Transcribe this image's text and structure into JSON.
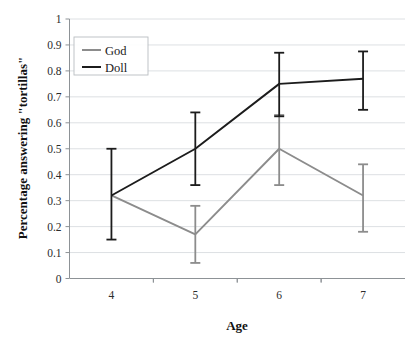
{
  "chart_data": {
    "type": "line",
    "title": "",
    "xlabel": "Age",
    "ylabel": "Percentage answering \"tortillas\"",
    "categories": [
      "4",
      "5",
      "6",
      "7"
    ],
    "x": [
      4,
      5,
      6,
      7
    ],
    "xlim": [
      3.5,
      7.5
    ],
    "ylim": [
      0,
      1
    ],
    "ytick_labels": [
      "0",
      "0.1",
      "0.2",
      "0.3",
      "0.4",
      "0.5",
      "0.6",
      "0.7",
      "0.8",
      "0.9",
      "1"
    ],
    "ytick_values": [
      0,
      0.1,
      0.2,
      0.3,
      0.4,
      0.5,
      0.6,
      0.7,
      0.8,
      0.9,
      1
    ],
    "grid": true,
    "legend_position": "top-left",
    "series": [
      {
        "name": "God",
        "color": "#8c8c8c",
        "values": [
          0.32,
          0.17,
          0.5,
          0.32
        ],
        "error_low": [
          0.32,
          0.06,
          0.36,
          0.18
        ],
        "error_high": [
          0.32,
          0.28,
          0.63,
          0.44
        ]
      },
      {
        "name": "Doll",
        "color": "#1c1c1c",
        "values": [
          0.32,
          0.5,
          0.75,
          0.77
        ],
        "error_low": [
          0.15,
          0.36,
          0.625,
          0.65
        ],
        "error_high": [
          0.5,
          0.64,
          0.87,
          0.875
        ]
      }
    ]
  },
  "legend": {
    "entries": [
      {
        "label": "God"
      },
      {
        "label": "Doll"
      }
    ]
  },
  "colors": {
    "god_series": "#8c8c8c",
    "doll_series": "#1c1c1c",
    "gridline": "#d9dde0",
    "axis": "#8d9296",
    "background": "#ffffff"
  }
}
